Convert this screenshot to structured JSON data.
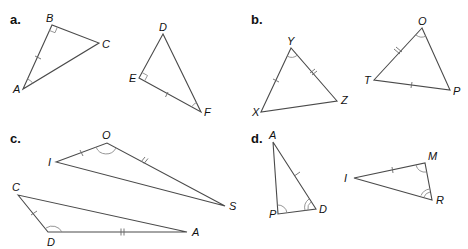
{
  "parts": [
    {
      "label": "a.",
      "triangles": [
        {
          "name": "ABC",
          "vertices": {
            "A": "A",
            "B": "B",
            "C": "C"
          },
          "marks": [
            "right angle at B",
            "single tick on AB",
            "single arc angle at A"
          ]
        },
        {
          "name": "DEF",
          "vertices": {
            "D": "D",
            "E": "E",
            "F": "F"
          },
          "marks": [
            "right angle at E",
            "single tick on EF",
            "single arc angle at F"
          ]
        }
      ]
    },
    {
      "label": "b.",
      "triangles": [
        {
          "name": "XYZ",
          "vertices": {
            "X": "X",
            "Y": "Y",
            "Z": "Z"
          },
          "marks": [
            "single tick on XY",
            "double tick on YZ",
            "single arc angle at Y"
          ]
        },
        {
          "name": "OTP",
          "vertices": {
            "O": "O",
            "T": "T",
            "P": "P"
          },
          "marks": [
            "double tick on OT",
            "single tick on TP",
            "single arc angle at O"
          ]
        }
      ]
    },
    {
      "label": "c.",
      "triangles": [
        {
          "name": "IOS",
          "vertices": {
            "I": "I",
            "O": "O",
            "S": "S"
          },
          "marks": [
            "single tick on IO",
            "double tick on OS",
            "single arc angle at O"
          ]
        },
        {
          "name": "CDA",
          "vertices": {
            "C": "C",
            "D": "D",
            "A": "A"
          },
          "marks": [
            "single tick on CD",
            "double tick on DA",
            "single arc angle at D"
          ]
        }
      ]
    },
    {
      "label": "d.",
      "triangles": [
        {
          "name": "APD",
          "vertices": {
            "A": "A",
            "P": "P",
            "D": "D"
          },
          "marks": [
            "single tick on AD",
            "single arc angle at P",
            "double arc angle at D"
          ]
        },
        {
          "name": "IMR",
          "vertices": {
            "I": "I",
            "M": "M",
            "R": "R"
          },
          "marks": [
            "single tick on IM",
            "single arc angle at M",
            "double arc angle at R"
          ]
        }
      ]
    }
  ]
}
